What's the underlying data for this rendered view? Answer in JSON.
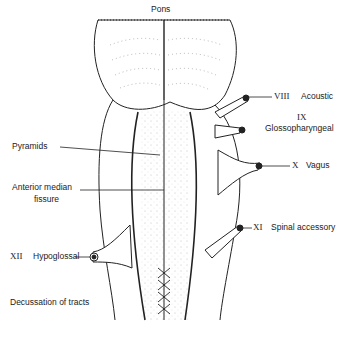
{
  "diagram": {
    "labels": {
      "pons": "Pons",
      "pyramids": "Pyramids",
      "anterior_median_fissure_line1": "Anterior median",
      "anterior_median_fissure_line2": "fissure",
      "hypoglossal_num": "XII",
      "hypoglossal_name": "Hypoglossal",
      "decussation": "Decussation of tracts",
      "acoustic_num": "VIII",
      "acoustic_name": "Acoustic",
      "glosso_num": "IX",
      "glosso_name": "Glossopharyngeal",
      "vagus_num": "X",
      "vagus_name": "Vagus",
      "spinal_num": "XI",
      "spinal_name": "Spinal accessory"
    },
    "colors": {
      "ink": "#222222",
      "background": "#ffffff"
    }
  }
}
